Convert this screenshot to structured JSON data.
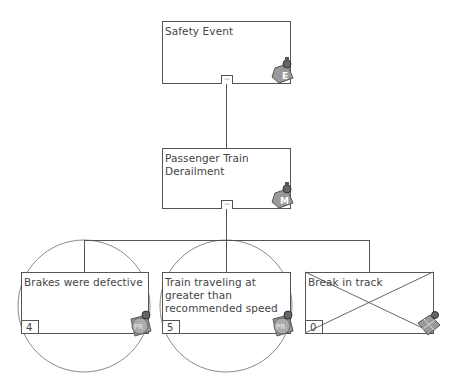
{
  "diagram": {
    "type": "event-tree",
    "nodes": [
      {
        "id": "root",
        "label": "Safety Event",
        "toggle": "--",
        "badge": "E"
      },
      {
        "id": "mid",
        "label": "Passenger Train Derailment",
        "toggle": "--",
        "badge": "M"
      },
      {
        "id": "c1",
        "label": "Brakes were defective",
        "count": "4",
        "badge": "PR"
      },
      {
        "id": "c2",
        "label": "Train traveling at greater than recommended speed",
        "count": "5",
        "badge": "PR"
      },
      {
        "id": "c3",
        "label": "Break in track",
        "count": "0",
        "badge": "crossed-out"
      }
    ],
    "edges": [
      [
        "root",
        "mid"
      ],
      [
        "mid",
        "c1"
      ],
      [
        "mid",
        "c2"
      ],
      [
        "mid",
        "c3"
      ]
    ]
  },
  "colors": {
    "line": "#555555",
    "circle": "#888888",
    "text": "#444444"
  }
}
